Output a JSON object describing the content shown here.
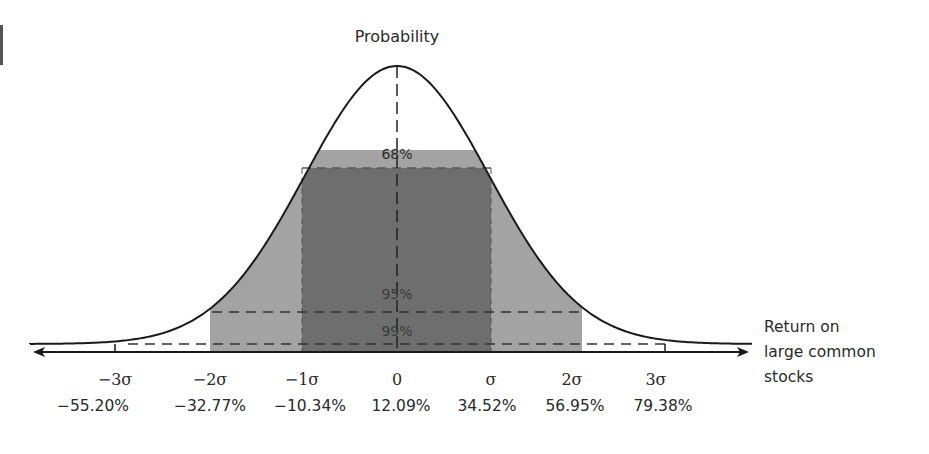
{
  "chart_data": {
    "type": "area",
    "title": "Probability",
    "xlabel": "Return on large common stocks",
    "ylabel": "Probability",
    "distribution": "normal",
    "mean_percent": 12.09,
    "std_dev_percent": 22.43,
    "x_ticks": [
      {
        "sigma": "−3σ",
        "value": "−55.20%"
      },
      {
        "sigma": "−2σ",
        "value": "−32.77%"
      },
      {
        "sigma": "−1σ",
        "value": "−10.34%"
      },
      {
        "sigma": "0",
        "value": "12.09%"
      },
      {
        "sigma": "σ",
        "value": "34.52%"
      },
      {
        "sigma": "2σ",
        "value": "56.95%"
      },
      {
        "sigma": "3σ",
        "value": "79.38%"
      }
    ],
    "regions": [
      {
        "label": "68%",
        "range_sigma": [
          -1,
          1
        ],
        "color": "#6e6e6e"
      },
      {
        "label": "95%",
        "range_sigma": [
          -2,
          2
        ],
        "color": "#a3a3a3"
      },
      {
        "label": "99%",
        "range_sigma": [
          -3,
          3
        ],
        "color": "#ffffff"
      }
    ],
    "grid": false
  },
  "labels": {
    "title": "Probability",
    "pct68": "68%",
    "pct95": "95%",
    "pct99": "99%",
    "axis_line1": "Return on",
    "axis_line2": "large common",
    "axis_line3": "stocks"
  }
}
